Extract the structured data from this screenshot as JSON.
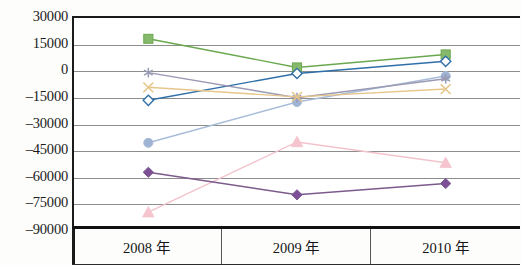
{
  "chart_data": {
    "type": "line",
    "title": "",
    "subtitle": "",
    "xlabel": "",
    "ylabel": "",
    "categories": [
      "2008 年",
      "2009 年",
      "2010 年"
    ],
    "ylim": [
      -90000,
      30000
    ],
    "ytick_values": [
      30000,
      15000,
      0,
      -15000,
      -30000,
      -45000,
      -60000,
      -75000,
      -90000
    ],
    "ytick_labels": [
      "30000",
      "15000",
      "0",
      "–15000",
      "–30000",
      "–45000",
      "–60000",
      "–75000",
      "–90000"
    ],
    "grid": true,
    "grid_axis": "y",
    "legend": "none",
    "series": [
      {
        "name": "series-green-square",
        "marker": "square",
        "color": "#6aa84f",
        "marker_fill": "#86b96c",
        "values": [
          18000,
          1500,
          9000
        ]
      },
      {
        "name": "series-blue-diamond",
        "marker": "diamond-open",
        "color": "#2f6fa8",
        "marker_fill": "#ffffff",
        "values": [
          -17500,
          -2000,
          5000
        ]
      },
      {
        "name": "series-lightblue-circle",
        "marker": "circle",
        "color": "#a8bcd8",
        "marker_fill": "#9fb4d4",
        "values": [
          -42000,
          -18500,
          -3500
        ]
      },
      {
        "name": "series-lavender-asterisk",
        "marker": "asterisk",
        "color": "#9a9ab4",
        "marker_fill": "#9a9ab4",
        "values": [
          -1500,
          -16000,
          -5000
        ]
      },
      {
        "name": "series-tan-cross",
        "marker": "cross",
        "color": "#e6c68a",
        "marker_fill": "#e6c68a",
        "values": [
          -10000,
          -15500,
          -11000
        ]
      },
      {
        "name": "series-pink-triangle",
        "marker": "triangle",
        "color": "#f3c3cd",
        "marker_fill": "#f5c4ce",
        "values": [
          -82000,
          -41500,
          -53500
        ]
      },
      {
        "name": "series-purple-diamond",
        "marker": "diamond",
        "color": "#7b5a8c",
        "marker_fill": "#7d4f96",
        "values": [
          -59000,
          -72000,
          -65500
        ]
      }
    ]
  }
}
